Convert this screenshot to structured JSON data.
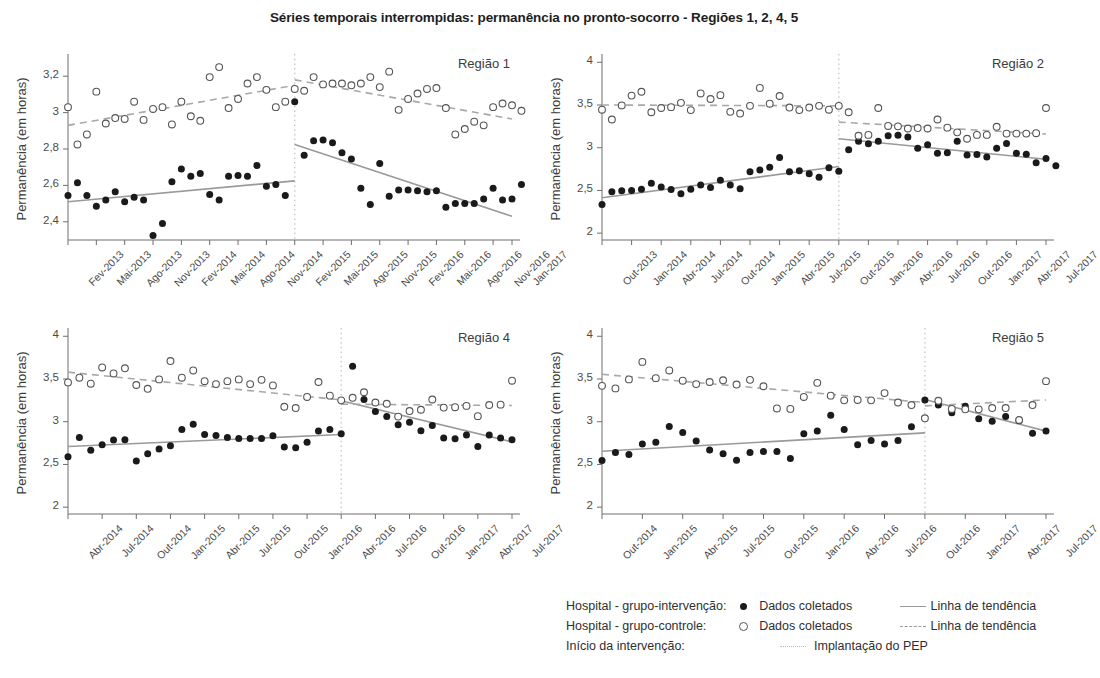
{
  "figure": {
    "title": "Séries temporais interrompidas: permanência no pronto-socorro - Regiões 1, 2, 4, 5",
    "ylabel": "Permanência (em horas)",
    "footer_caption": ""
  },
  "legend": {
    "rows": [
      {
        "key": "Hospital - grupo-intervenção:",
        "marker": "filled-circle",
        "data_label": "Dados coletados",
        "line": "solid",
        "line_label": "Linha de tendência"
      },
      {
        "key": "Hospital - grupo-controle:",
        "marker": "open-circle",
        "data_label": "Dados coletados",
        "line": "dashed",
        "line_label": "Linha de tendência"
      },
      {
        "key": "Início da intervenção:",
        "marker": "none",
        "data_label": "",
        "line": "dotted",
        "line_label": "Implantação do PEP"
      }
    ]
  },
  "colors": {
    "intervention_points": "#1a1a1a",
    "control_points": "#ffffff",
    "control_points_stroke": "#555555",
    "intervention_trend": "#9a9a9a",
    "control_trend": "#a8a8a8",
    "intervention_marker_line": "#c9c9c9",
    "axis": "#6e6e6e",
    "text": "#3c3c3c"
  },
  "chart_data": [
    {
      "id": "regiao-1",
      "type": "scatter",
      "title": "Região 1",
      "xlabel": "",
      "ylabel": "Permanência (em horas)",
      "ylim": [
        2.3,
        3.3
      ],
      "yticks": [
        2.4,
        2.6,
        2.8,
        3.0,
        3.2
      ],
      "ytick_labels": [
        "2,4",
        "2,6",
        "2,8",
        "3",
        "3,2"
      ],
      "xtick_labels": [
        "Fev-2013",
        "Mai-2013",
        "Ago-2013",
        "Nov-2013",
        "Fev-2014",
        "Mai-2014",
        "Ago-2014",
        "Nov-2014",
        "Fev-2015",
        "Mai-2015",
        "Ago-2015",
        "Nov-2015",
        "Fev-2016",
        "Mai-2016",
        "Ago-2016",
        "Nov-2016",
        "Jan-2017"
      ],
      "xtick_index": [
        0,
        3,
        6,
        9,
        12,
        15,
        18,
        21,
        24,
        27,
        30,
        33,
        36,
        39,
        42,
        45,
        47
      ],
      "n_points": 48,
      "intervention_index": 24,
      "intervention_label": "Implantação do PEP",
      "grid": false,
      "legend_position": "external-bottom",
      "series": [
        {
          "name": "Hospital - grupo-intervenção: Dados coletados",
          "marker": "filled-circle",
          "values": [
            2.545,
            2.615,
            2.545,
            2.485,
            2.52,
            2.565,
            2.51,
            2.535,
            2.52,
            2.325,
            2.39,
            2.62,
            2.69,
            2.65,
            2.665,
            2.55,
            2.52,
            2.65,
            2.655,
            2.65,
            2.71,
            2.595,
            2.605,
            2.545,
            3.06,
            2.765,
            2.845,
            2.85,
            2.835,
            2.78,
            2.745,
            2.585,
            2.495,
            2.72,
            2.54,
            2.575,
            2.575,
            2.57,
            2.565,
            2.57,
            2.48,
            2.5,
            2.5,
            2.5,
            2.525,
            2.585,
            2.52,
            2.525,
            2.605
          ]
        },
        {
          "name": "Hospital - grupo-controle: Dados coletados",
          "marker": "open-circle",
          "values": [
            3.03,
            2.825,
            2.88,
            3.115,
            2.94,
            2.97,
            2.965,
            3.06,
            2.96,
            3.02,
            3.03,
            2.935,
            3.06,
            2.98,
            2.955,
            3.195,
            3.25,
            3.025,
            3.075,
            3.16,
            3.195,
            3.125,
            3.03,
            3.06,
            3.13,
            3.12,
            3.195,
            3.155,
            3.16,
            3.16,
            3.15,
            3.16,
            3.195,
            3.14,
            3.225,
            3.015,
            3.075,
            3.105,
            3.13,
            3.135,
            3.025,
            2.88,
            2.91,
            2.95,
            2.93,
            3.03,
            3.05,
            3.04,
            3.01
          ]
        }
      ],
      "trend_lines": [
        {
          "name": "intervenção - pré",
          "style": "solid",
          "x0_index": 0,
          "x1_index": 24,
          "y0": 2.51,
          "y1": 2.625
        },
        {
          "name": "intervenção - pós",
          "style": "solid",
          "x0_index": 24,
          "x1_index": 47,
          "y0": 2.825,
          "y1": 2.43
        },
        {
          "name": "controle - pré",
          "style": "dashed",
          "x0_index": 0,
          "x1_index": 24,
          "y0": 2.93,
          "y1": 3.15
        },
        {
          "name": "controle - pós",
          "style": "dashed",
          "x0_index": 24,
          "x1_index": 47,
          "y0": 3.18,
          "y1": 2.965
        }
      ]
    },
    {
      "id": "regiao-2",
      "type": "scatter",
      "title": "Região 2",
      "xlabel": "",
      "ylabel": "Permanência (em horas)",
      "ylim": [
        1.92,
        4.05
      ],
      "yticks": [
        2.0,
        2.5,
        3.0,
        3.5,
        4.0
      ],
      "ytick_labels": [
        "2",
        "2,5",
        "3",
        "3,5",
        "4"
      ],
      "xtick_labels": [
        "Out-2013",
        "Jan-2014",
        "Abr-2014",
        "Jul-2014",
        "Out-2014",
        "Jan-2015",
        "Abr-2015",
        "Jul-2015",
        "Out-2015",
        "Jan-2016",
        "Abr-2016",
        "Jul-2016",
        "Out-2016",
        "Jan-2017",
        "Abr-2017",
        "Jul-2017"
      ],
      "xtick_index": [
        0,
        3,
        6,
        9,
        12,
        15,
        18,
        21,
        24,
        27,
        30,
        33,
        36,
        39,
        42,
        45
      ],
      "n_points": 46,
      "intervention_index": 24,
      "intervention_label": "Implantação do PEP",
      "grid": false,
      "legend_position": "external-bottom",
      "series": [
        {
          "name": "Hospital - grupo-intervenção: Dados coletados",
          "marker": "filled-circle",
          "values": [
            2.335,
            2.485,
            2.495,
            2.5,
            2.515,
            2.585,
            2.54,
            2.51,
            2.46,
            2.515,
            2.565,
            2.535,
            2.62,
            2.565,
            2.52,
            2.72,
            2.74,
            2.77,
            2.885,
            2.72,
            2.73,
            2.695,
            2.655,
            2.765,
            2.725,
            2.975,
            3.075,
            3.045,
            3.075,
            3.14,
            3.145,
            3.125,
            2.995,
            3.035,
            2.935,
            2.94,
            3.075,
            2.915,
            2.92,
            2.89,
            2.995,
            3.05,
            2.935,
            2.925,
            2.825,
            2.875,
            2.79
          ]
        },
        {
          "name": "Hospital - grupo-controle: Dados coletados",
          "marker": "open-circle",
          "values": [
            3.445,
            3.33,
            3.495,
            3.61,
            3.655,
            3.415,
            3.465,
            3.475,
            3.525,
            3.44,
            3.635,
            3.57,
            3.615,
            3.42,
            3.4,
            3.49,
            3.7,
            3.515,
            3.605,
            3.47,
            3.44,
            3.47,
            3.49,
            3.445,
            3.49,
            3.415,
            3.14,
            3.15,
            3.465,
            3.255,
            3.25,
            3.225,
            3.23,
            3.225,
            3.33,
            3.235,
            3.18,
            3.105,
            3.15,
            3.15,
            3.245,
            3.165,
            3.165,
            3.165,
            3.17,
            3.465
          ]
        }
      ],
      "trend_lines": [
        {
          "name": "intervenção - pré",
          "style": "solid",
          "x0_index": 0,
          "x1_index": 24,
          "y0": 2.415,
          "y1": 2.78
        },
        {
          "name": "intervenção - pós",
          "style": "solid",
          "x0_index": 24,
          "x1_index": 45,
          "y0": 3.105,
          "y1": 2.865
        },
        {
          "name": "controle - pré",
          "style": "dashed",
          "x0_index": 0,
          "x1_index": 24,
          "y0": 3.5,
          "y1": 3.49
        },
        {
          "name": "controle - pós",
          "style": "dashed",
          "x0_index": 24,
          "x1_index": 45,
          "y0": 3.3,
          "y1": 3.16
        }
      ]
    },
    {
      "id": "regiao-4",
      "type": "scatter",
      "title": "Região 4",
      "xlabel": "",
      "ylabel": "Permanência (em horas)",
      "ylim": [
        1.92,
        4.05
      ],
      "yticks": [
        2.0,
        2.5,
        3.0,
        3.5,
        4.0
      ],
      "ytick_labels": [
        "2",
        "2,5",
        "3",
        "3,5",
        "4"
      ],
      "xtick_labels": [
        "Abr-2014",
        "Jul-2014",
        "Out-2014",
        "Jan-2015",
        "Abr-2015",
        "Jul-2015",
        "Out-2015",
        "Jan-2016",
        "Abr-2016",
        "Jul-2016",
        "Out-2016",
        "Jan-2017",
        "Abr-2017",
        "Jul-2017"
      ],
      "xtick_index": [
        0,
        3,
        6,
        9,
        12,
        15,
        18,
        21,
        24,
        27,
        30,
        33,
        36,
        39
      ],
      "n_points": 40,
      "intervention_index": 24,
      "intervention_label": "Implantação do PEP",
      "grid": false,
      "legend_position": "external-bottom",
      "series": [
        {
          "name": "Hospital - grupo-intervenção: Dados coletados",
          "marker": "filled-circle",
          "values": [
            2.59,
            2.815,
            2.665,
            2.73,
            2.785,
            2.79,
            2.54,
            2.625,
            2.68,
            2.72,
            2.91,
            2.97,
            2.85,
            2.84,
            2.815,
            2.805,
            2.805,
            2.805,
            2.835,
            2.705,
            2.695,
            2.76,
            2.89,
            2.91,
            2.86,
            3.65,
            3.26,
            3.12,
            3.06,
            2.965,
            2.995,
            2.895,
            2.955,
            2.81,
            2.8,
            2.845,
            2.71,
            2.845,
            2.81,
            2.79
          ]
        },
        {
          "name": "Hospital - grupo-controle: Dados coletados",
          "marker": "open-circle",
          "values": [
            3.46,
            3.515,
            3.445,
            3.635,
            3.565,
            3.625,
            3.43,
            3.385,
            3.495,
            3.71,
            3.515,
            3.6,
            3.475,
            3.44,
            3.475,
            3.495,
            3.44,
            3.49,
            3.425,
            3.175,
            3.16,
            3.29,
            3.465,
            3.305,
            3.25,
            3.28,
            3.345,
            3.225,
            3.21,
            3.06,
            3.125,
            3.14,
            3.26,
            3.165,
            3.17,
            3.185,
            3.065,
            3.195,
            3.2,
            3.48
          ]
        }
      ],
      "trend_lines": [
        {
          "name": "intervenção - pré",
          "style": "solid",
          "x0_index": 0,
          "x1_index": 24,
          "y0": 2.71,
          "y1": 2.85
        },
        {
          "name": "intervenção - pós",
          "style": "solid",
          "x0_index": 24,
          "x1_index": 39,
          "y0": 3.245,
          "y1": 2.765
        },
        {
          "name": "controle - pré",
          "style": "dashed",
          "x0_index": 0,
          "x1_index": 24,
          "y0": 3.58,
          "y1": 3.255
        },
        {
          "name": "controle - pós",
          "style": "dashed",
          "x0_index": 24,
          "x1_index": 39,
          "y0": 3.205,
          "y1": 3.19
        }
      ]
    },
    {
      "id": "regiao-5",
      "type": "scatter",
      "title": "Região 5",
      "xlabel": "",
      "ylabel": "Permanência (em horas)",
      "ylim": [
        1.92,
        4.05
      ],
      "yticks": [
        2.0,
        2.5,
        3.0,
        3.5,
        4.0
      ],
      "ytick_labels": [
        "2",
        "2,5",
        "3",
        "3,5",
        "4"
      ],
      "xtick_labels": [
        "Out-2014",
        "Jan-2015",
        "Abr-2015",
        "Jul-2015",
        "Out-2015",
        "Jan-2016",
        "Abr-2016",
        "Jul-2016",
        "Out-2016",
        "Jan-2017",
        "Abr-2017",
        "Jul-2017"
      ],
      "xtick_index": [
        0,
        3,
        6,
        9,
        12,
        15,
        18,
        21,
        24,
        27,
        30,
        33
      ],
      "n_points": 34,
      "intervention_index": 24,
      "intervention_label": "Implantação do PEP",
      "grid": false,
      "legend_position": "external-bottom",
      "series": [
        {
          "name": "Hospital - grupo-intervenção: Dados coletados",
          "marker": "filled-circle",
          "values": [
            2.545,
            2.64,
            2.615,
            2.74,
            2.76,
            2.945,
            2.875,
            2.775,
            2.67,
            2.625,
            2.55,
            2.64,
            2.65,
            2.65,
            2.57,
            2.86,
            2.89,
            3.075,
            2.91,
            2.73,
            2.78,
            2.74,
            2.78,
            2.94,
            3.255,
            3.195,
            3.105,
            3.18,
            3.035,
            3.005,
            3.06,
            3.01,
            2.865,
            2.89
          ]
        },
        {
          "name": "Hospital - grupo-controle: Dados coletados",
          "marker": "open-circle",
          "values": [
            3.42,
            3.39,
            3.495,
            3.7,
            3.51,
            3.6,
            3.48,
            3.44,
            3.465,
            3.485,
            3.435,
            3.49,
            3.415,
            3.155,
            3.15,
            3.29,
            3.455,
            3.305,
            3.25,
            3.255,
            3.25,
            3.335,
            3.225,
            3.195,
            3.04,
            3.245,
            3.15,
            3.145,
            3.145,
            3.16,
            3.16,
            3.02,
            3.195,
            3.475
          ]
        }
      ],
      "trend_lines": [
        {
          "name": "intervenção - pré",
          "style": "solid",
          "x0_index": 0,
          "x1_index": 24,
          "y0": 2.655,
          "y1": 2.87
        },
        {
          "name": "intervenção - pós",
          "style": "solid",
          "x0_index": 24,
          "x1_index": 33,
          "y0": 3.26,
          "y1": 2.89
        },
        {
          "name": "controle - pré",
          "style": "dashed",
          "x0_index": 0,
          "x1_index": 24,
          "y0": 3.555,
          "y1": 3.225
        },
        {
          "name": "controle - pós",
          "style": "dashed",
          "x0_index": 24,
          "x1_index": 33,
          "y0": 3.185,
          "y1": 3.255
        }
      ]
    }
  ]
}
